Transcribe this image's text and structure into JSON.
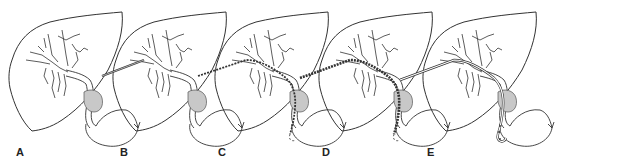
{
  "figure": {
    "panels": [
      {
        "label": "A",
        "stage": "liver-biliary-tree"
      },
      {
        "label": "B",
        "stage": "needle-puncture"
      },
      {
        "label": "C",
        "stage": "guidewire-advanced-into-duodenum"
      },
      {
        "label": "D",
        "stage": "catheter-over-guidewire"
      },
      {
        "label": "E",
        "stage": "drainage-catheter-in-place"
      }
    ]
  },
  "colors": {
    "line": "#333333",
    "fill_gray": "#c8c8c8",
    "background": "#ffffff"
  }
}
